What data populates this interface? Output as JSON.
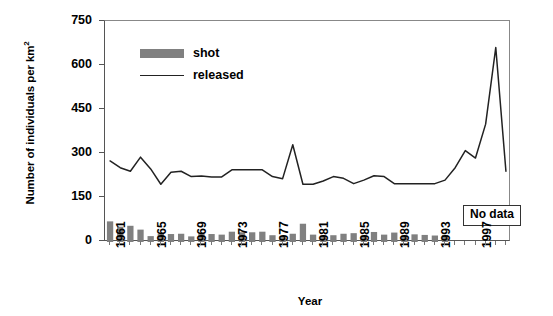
{
  "chart_data": {
    "type": "bar",
    "title": "",
    "xlabel": "Year",
    "ylabel": "Number of individuals per km2",
    "ylabel_html": "Number of individuals per km<sup>2</sup>",
    "ylim": [
      0,
      750
    ],
    "yticks": [
      0,
      150,
      300,
      450,
      600,
      750
    ],
    "xlim": [
      1961,
      2000
    ],
    "xticks": [
      1961,
      1965,
      1969,
      1973,
      1977,
      1981,
      1985,
      1989,
      1993,
      1997
    ],
    "grid": false,
    "legend_position": "upper-left-inside",
    "legend": [
      "shot",
      "released"
    ],
    "annotations": [
      {
        "text": "No data",
        "position": "lower-right",
        "boxed": true
      }
    ],
    "categories": [
      1961,
      1962,
      1963,
      1964,
      1965,
      1966,
      1967,
      1968,
      1969,
      1970,
      1971,
      1972,
      1973,
      1974,
      1975,
      1976,
      1977,
      1978,
      1979,
      1980,
      1981,
      1982,
      1983,
      1984,
      1985,
      1986,
      1987,
      1988,
      1989,
      1990,
      1991,
      1992,
      1993,
      1994,
      1995,
      1996,
      1997,
      1998,
      1999,
      2000
    ],
    "series": [
      {
        "name": "shot",
        "type": "bar",
        "color": "#808080",
        "values": [
          70,
          52,
          55,
          42,
          20,
          28,
          27,
          28,
          19,
          29,
          27,
          25,
          35,
          33,
          33,
          35,
          23,
          20,
          28,
          62,
          25,
          22,
          23,
          28,
          30,
          22,
          34,
          25,
          32,
          22,
          26,
          24,
          22,
          24,
          null,
          null,
          null,
          null,
          null,
          null
        ]
      },
      {
        "name": "released",
        "type": "line",
        "color": "#222222",
        "values": [
          275,
          252,
          240,
          288,
          248,
          196,
          237,
          240,
          222,
          224,
          221,
          221,
          245,
          245,
          245,
          245,
          222,
          215,
          330,
          196,
          196,
          207,
          222,
          216,
          198,
          210,
          225,
          222,
          198,
          198,
          198,
          198,
          198,
          210,
          252,
          310,
          285,
          400,
          660,
          240
        ]
      }
    ]
  },
  "legend_items": [
    {
      "label": "shot",
      "marker": "bar-swatch"
    },
    {
      "label": "released",
      "marker": "line-swatch"
    }
  ],
  "axis_titles": {
    "x": "Year",
    "y_text": "Number of individuals per km",
    "y_sup": "2"
  },
  "ytick_labels": [
    "750",
    "600",
    "450",
    "300",
    "150",
    "0"
  ],
  "xtick_labels": [
    "1961",
    "1965",
    "1969",
    "1973",
    "1977",
    "1981",
    "1985",
    "1989",
    "1993",
    "1997"
  ],
  "no_data_label": "No data"
}
